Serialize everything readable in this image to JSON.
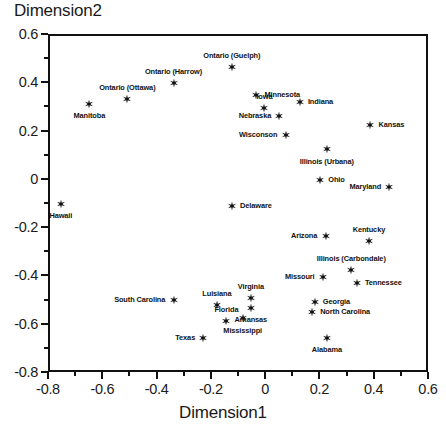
{
  "chart_data": {
    "type": "scatter",
    "title": "",
    "xlabel": "Dimension1",
    "ylabel": "Dimension2",
    "xlim": [
      -0.8,
      0.6
    ],
    "ylim": [
      -0.8,
      0.6
    ],
    "xticks": [
      "-0.8",
      "-0.6",
      "-0.4",
      "-0.2",
      "0",
      "0.2",
      "0.4",
      "0.6"
    ],
    "xtickvals": [
      -0.8,
      -0.6,
      -0.4,
      -0.2,
      0,
      0.2,
      0.4,
      0.6
    ],
    "yticks": [
      "0.6",
      "0.4",
      "0.2",
      "0",
      "-0.2",
      "-0.4",
      "-0.6",
      "-0.8"
    ],
    "ytickvals": [
      0.6,
      0.4,
      0.2,
      0,
      -0.2,
      -0.4,
      -0.6,
      -0.8
    ],
    "minor_tick_step": 0.1,
    "grid": false,
    "legend": "none",
    "marker": "star",
    "marker_color": "#111111",
    "points": [
      {
        "label": "Manitoba",
        "x": -0.655,
        "y": 0.318,
        "pos": "b"
      },
      {
        "label": "Ontario (Ottawa)",
        "x": -0.515,
        "y": 0.34,
        "pos": "a"
      },
      {
        "label": "Ontario (Harrow)",
        "x": -0.345,
        "y": 0.405,
        "pos": "a"
      },
      {
        "label": "Ontario (Guelph)",
        "x": -0.13,
        "y": 0.47,
        "pos": "a"
      },
      {
        "label": "Minnesota",
        "x": -0.04,
        "y": 0.355,
        "pos": "r"
      },
      {
        "label": "Iowa",
        "x": -0.01,
        "y": 0.3,
        "pos": "a"
      },
      {
        "label": "Nebraska",
        "x": 0.045,
        "y": 0.27,
        "pos": "l"
      },
      {
        "label": "Indiana",
        "x": 0.12,
        "y": 0.325,
        "pos": "r"
      },
      {
        "label": "Kansas",
        "x": 0.38,
        "y": 0.23,
        "pos": "r"
      },
      {
        "label": "Wisconson",
        "x": 0.068,
        "y": 0.19,
        "pos": "l"
      },
      {
        "label": "Illinois (Urbana)",
        "x": 0.22,
        "y": 0.13,
        "pos": "b"
      },
      {
        "label": "Ohio",
        "x": 0.195,
        "y": 0.005,
        "pos": "r"
      },
      {
        "label": "Maryland",
        "x": 0.45,
        "y": -0.025,
        "pos": "l"
      },
      {
        "label": "Hawaii",
        "x": -0.76,
        "y": -0.095,
        "pos": "b"
      },
      {
        "label": "Delaware",
        "x": -0.13,
        "y": -0.105,
        "pos": "r"
      },
      {
        "label": "Arizona",
        "x": 0.215,
        "y": -0.23,
        "pos": "l"
      },
      {
        "label": "Kentucky",
        "x": 0.375,
        "y": -0.25,
        "pos": "a"
      },
      {
        "label": "Illinois (Carbondale)",
        "x": 0.31,
        "y": -0.37,
        "pos": "a"
      },
      {
        "label": "Missouri",
        "x": 0.205,
        "y": -0.4,
        "pos": "l"
      },
      {
        "label": "Tennessee",
        "x": 0.33,
        "y": -0.425,
        "pos": "r"
      },
      {
        "label": "South Carolina",
        "x": -0.345,
        "y": -0.495,
        "pos": "l"
      },
      {
        "label": "Luisiana",
        "x": -0.185,
        "y": -0.515,
        "pos": "a"
      },
      {
        "label": "Virginia",
        "x": -0.06,
        "y": -0.485,
        "pos": "a"
      },
      {
        "label": "Arkansas",
        "x": -0.06,
        "y": -0.525,
        "pos": "b"
      },
      {
        "label": "Georgia",
        "x": 0.175,
        "y": -0.5,
        "pos": "r"
      },
      {
        "label": "North Carolina",
        "x": 0.165,
        "y": -0.545,
        "pos": "r"
      },
      {
        "label": "Florida",
        "x": -0.15,
        "y": -0.58,
        "pos": "a"
      },
      {
        "label": "Mississippi",
        "x": -0.09,
        "y": -0.57,
        "pos": "b"
      },
      {
        "label": "Texas",
        "x": -0.235,
        "y": -0.65,
        "pos": "l"
      },
      {
        "label": "Alabama",
        "x": 0.22,
        "y": -0.65,
        "pos": "b"
      }
    ]
  }
}
